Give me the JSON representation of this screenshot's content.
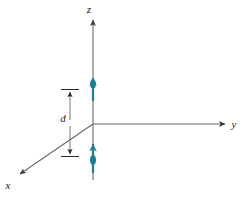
{
  "figure": {
    "title": "",
    "type": "coordinate-axes-diagram",
    "background_color": "#ffffff",
    "axis_color": "#4a4a4a",
    "arrow_color": "#1b7f92",
    "dimension_color": "#2a2a2a",
    "label_color": "#1a1a1a"
  },
  "axes": {
    "origin": {
      "x": 93,
      "y": 124
    },
    "z": {
      "label": "z",
      "label_pos": {
        "x": 90,
        "y": 12
      },
      "start": {
        "x": 93,
        "y": 180
      },
      "end": {
        "x": 93,
        "y": 18
      },
      "direction": "up"
    },
    "y": {
      "label": "y",
      "label_pos": {
        "x": 234,
        "y": 128
      },
      "start": {
        "x": 93,
        "y": 124
      },
      "end": {
        "x": 228,
        "y": 124
      },
      "direction": "right"
    },
    "x": {
      "label": "x",
      "label_pos": {
        "x": 6,
        "y": 188
      },
      "start": {
        "x": 93,
        "y": 124
      },
      "end": {
        "x": 16,
        "y": 177
      },
      "direction": "down-left"
    }
  },
  "dimension": {
    "label": "d",
    "label_pos": {
      "x": 63,
      "y": 122
    },
    "line_x": 70,
    "top_y": 90,
    "bottom_y": 156,
    "tick_half_width": 9
  },
  "dipoles": [
    {
      "name": "upper-dipole-arrow",
      "x": 93,
      "tail_y": 101,
      "head_y": 74,
      "color": "#1b7f92"
    },
    {
      "name": "lower-dipole-arrow",
      "x": 93,
      "tail_y": 173,
      "head_y": 140,
      "color": "#1b7f92"
    }
  ]
}
